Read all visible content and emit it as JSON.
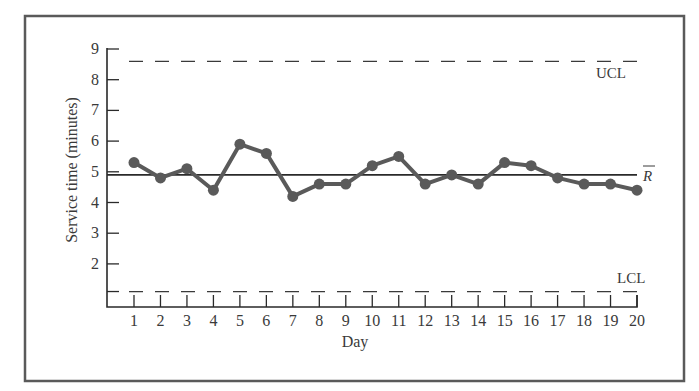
{
  "chart_data": {
    "type": "line",
    "title": "",
    "xlabel": "Day",
    "ylabel": "Service time (minutes)",
    "x": [
      1,
      2,
      3,
      4,
      5,
      6,
      7,
      8,
      9,
      10,
      11,
      12,
      13,
      14,
      15,
      16,
      17,
      18,
      19,
      20
    ],
    "x_tick_labels": [
      "1",
      "2",
      "3",
      "4",
      "5",
      "6",
      "7",
      "8",
      "9",
      "10",
      "11",
      "12",
      "13",
      "14",
      "15",
      "16",
      "17",
      "18",
      "19",
      "20"
    ],
    "y_tick_labels": [
      "2",
      "3",
      "4",
      "5",
      "6",
      "7",
      "8",
      "9"
    ],
    "ylim": [
      0.5,
      9
    ],
    "xlim": [
      0,
      20
    ],
    "series": [
      {
        "name": "Service time",
        "values": [
          5.3,
          4.8,
          5.1,
          4.4,
          5.9,
          5.6,
          4.2,
          4.6,
          4.6,
          5.2,
          5.5,
          4.6,
          4.9,
          4.6,
          5.3,
          5.2,
          4.8,
          4.6,
          4.6,
          4.4
        ]
      }
    ],
    "reference_lines": [
      {
        "name": "UCL",
        "label": "UCL",
        "value": 8.6,
        "style": "dashed"
      },
      {
        "name": "Center line",
        "label": "R̄",
        "value": 4.9,
        "style": "solid"
      },
      {
        "name": "LCL",
        "label": "LCL",
        "value": 1.1,
        "style": "dashed"
      }
    ],
    "grid": false,
    "legend": "none"
  },
  "labels": {
    "xlabel": "Day",
    "ylabel": "Service time (minutes)",
    "ucl": "UCL",
    "lcl": "LCL",
    "center": "R"
  },
  "colors": {
    "series": "#5a5a5a",
    "axis": "#2a2a2a",
    "frame": "#5a5a5a",
    "text": "#3a3a3a"
  }
}
